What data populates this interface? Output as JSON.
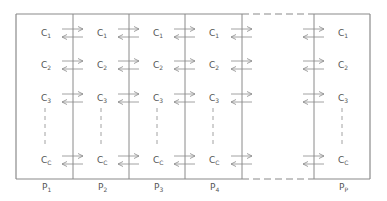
{
  "diagram": {
    "type": "partitioned-grid",
    "stroke_color": "#8a8a8a",
    "text_color": "#555555",
    "processors": [
      {
        "label": "P",
        "sub": "1",
        "x": 45
      },
      {
        "label": "P",
        "sub": "2",
        "x": 101
      },
      {
        "label": "P",
        "sub": "3",
        "x": 157
      },
      {
        "label": "P",
        "sub": "4",
        "x": 213
      },
      {
        "label": "P",
        "sub": "P",
        "x": 342
      }
    ],
    "cells": [
      {
        "label": "C",
        "sub": "1",
        "y": 33
      },
      {
        "label": "C",
        "sub": "2",
        "y": 65
      },
      {
        "label": "C",
        "sub": "3",
        "y": 98
      },
      {
        "label": "C",
        "sub": "C",
        "y": 160
      }
    ],
    "ellipsis": "vertical-dashed",
    "gap_between": [
      "P4",
      "PP"
    ],
    "arrows": "bidirectional exchange across each partition boundary per cell row"
  }
}
